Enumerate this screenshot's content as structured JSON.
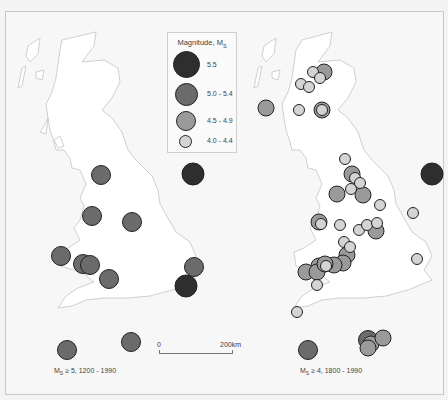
{
  "legend": {
    "title": "Magnitude, M",
    "title_sub": "S",
    "classes": [
      {
        "label": "5.5",
        "color": "#2e2e2e",
        "size": 22
      },
      {
        "label": "5.0 - 5.4",
        "color": "#6b6b6b",
        "size": 19
      },
      {
        "label": "4.5 - 4.9",
        "color": "#9a9a9a",
        "size": 16
      },
      {
        "label": "4.0 - 4.4",
        "color": "#d4d4d4",
        "size": 11
      }
    ]
  },
  "scale": {
    "start_label": "0",
    "end_label": "200km"
  },
  "maps": [
    {
      "caption_prefix": "M",
      "caption_sub": "S",
      "caption_suffix": " ≥ 5, 1200 - 1990",
      "events": [
        {
          "x": 101,
          "y": 175,
          "cls": 1
        },
        {
          "x": 193,
          "y": 174,
          "cls": 0
        },
        {
          "x": 92,
          "y": 216,
          "cls": 1
        },
        {
          "x": 132,
          "y": 222,
          "cls": 1
        },
        {
          "x": 61,
          "y": 256,
          "cls": 1
        },
        {
          "x": 83,
          "y": 264,
          "cls": 1
        },
        {
          "x": 90,
          "y": 265,
          "cls": 1
        },
        {
          "x": 109,
          "y": 279,
          "cls": 1
        },
        {
          "x": 194,
          "y": 267,
          "cls": 1
        },
        {
          "x": 186,
          "y": 286,
          "cls": 0
        },
        {
          "x": 67,
          "y": 350,
          "cls": 1
        },
        {
          "x": 131,
          "y": 342,
          "cls": 1
        }
      ]
    },
    {
      "caption_prefix": "M",
      "caption_sub": "S",
      "caption_suffix": " ≥ 4, 1800 - 1990",
      "events": [
        {
          "x": 266,
          "y": 108,
          "cls": 2
        },
        {
          "x": 324,
          "y": 72,
          "cls": 2
        },
        {
          "x": 313,
          "y": 72,
          "cls": 3
        },
        {
          "x": 320,
          "y": 78,
          "cls": 3
        },
        {
          "x": 301,
          "y": 84,
          "cls": 3
        },
        {
          "x": 309,
          "y": 87,
          "cls": 3
        },
        {
          "x": 299,
          "y": 110,
          "cls": 3
        },
        {
          "x": 322,
          "y": 110,
          "cls": 2
        },
        {
          "x": 322,
          "y": 110,
          "cls": 3
        },
        {
          "x": 345,
          "y": 159,
          "cls": 3
        },
        {
          "x": 352,
          "y": 174,
          "cls": 2
        },
        {
          "x": 355,
          "y": 178,
          "cls": 3
        },
        {
          "x": 360,
          "y": 183,
          "cls": 3
        },
        {
          "x": 351,
          "y": 189,
          "cls": 3
        },
        {
          "x": 337,
          "y": 194,
          "cls": 2
        },
        {
          "x": 363,
          "y": 195,
          "cls": 2
        },
        {
          "x": 432,
          "y": 174,
          "cls": 0
        },
        {
          "x": 380,
          "y": 205,
          "cls": 3
        },
        {
          "x": 413,
          "y": 213,
          "cls": 3
        },
        {
          "x": 319,
          "y": 222,
          "cls": 2
        },
        {
          "x": 321,
          "y": 224,
          "cls": 3
        },
        {
          "x": 340,
          "y": 225,
          "cls": 3
        },
        {
          "x": 359,
          "y": 230,
          "cls": 3
        },
        {
          "x": 367,
          "y": 225,
          "cls": 3
        },
        {
          "x": 377,
          "y": 223,
          "cls": 3
        },
        {
          "x": 376,
          "y": 231,
          "cls": 2
        },
        {
          "x": 344,
          "y": 242,
          "cls": 3
        },
        {
          "x": 350,
          "y": 247,
          "cls": 3
        },
        {
          "x": 347,
          "y": 255,
          "cls": 2
        },
        {
          "x": 343,
          "y": 263,
          "cls": 2
        },
        {
          "x": 334,
          "y": 265,
          "cls": 2
        },
        {
          "x": 319,
          "y": 266,
          "cls": 2
        },
        {
          "x": 306,
          "y": 272,
          "cls": 2
        },
        {
          "x": 317,
          "y": 272,
          "cls": 2
        },
        {
          "x": 325,
          "y": 264,
          "cls": 2
        },
        {
          "x": 326,
          "y": 266,
          "cls": 3
        },
        {
          "x": 317,
          "y": 285,
          "cls": 3
        },
        {
          "x": 417,
          "y": 259,
          "cls": 3
        },
        {
          "x": 297,
          "y": 312,
          "cls": 3
        },
        {
          "x": 308,
          "y": 350,
          "cls": 1
        },
        {
          "x": 368,
          "y": 340,
          "cls": 1
        },
        {
          "x": 371,
          "y": 344,
          "cls": 2
        },
        {
          "x": 368,
          "y": 348,
          "cls": 2
        },
        {
          "x": 383,
          "y": 338,
          "cls": 2
        }
      ]
    }
  ]
}
